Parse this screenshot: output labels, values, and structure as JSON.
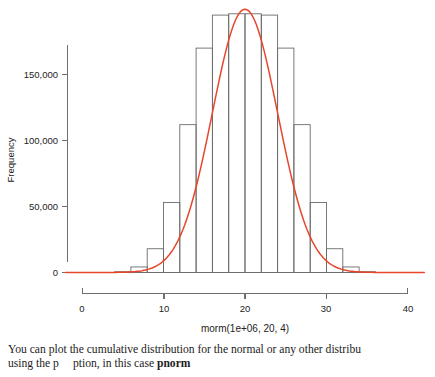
{
  "chart_data": {
    "type": "bar",
    "title": "",
    "subtitle": "",
    "xlabel": "morm(1e+06, 20, 4)",
    "ylabel": "Frequency",
    "xlim": [
      -2,
      42
    ],
    "ylim": [
      0,
      200000
    ],
    "grid": false,
    "legend_position": "none",
    "x_ticks": [
      0,
      10,
      20,
      30,
      40
    ],
    "x_tick_labels": [
      "0",
      "10",
      "20",
      "30",
      "40"
    ],
    "y_ticks": [
      0,
      50000,
      100000,
      150000
    ],
    "y_tick_labels": [
      "0",
      "50,000",
      "100,000",
      "150,000"
    ],
    "bin_width": 2,
    "bar_color": "none",
    "bar_edge_color": "#6b6b6b",
    "curve_color": "#e8462b",
    "bins": [
      {
        "x0": 2,
        "x1": 4,
        "count": 60
      },
      {
        "x0": 4,
        "x1": 6,
        "count": 600
      },
      {
        "x0": 6,
        "x1": 8,
        "count": 4200
      },
      {
        "x0": 8,
        "x1": 10,
        "count": 18000
      },
      {
        "x0": 10,
        "x1": 12,
        "count": 53000
      },
      {
        "x0": 12,
        "x1": 14,
        "count": 112000
      },
      {
        "x0": 14,
        "x1": 16,
        "count": 170000
      },
      {
        "x0": 16,
        "x1": 18,
        "count": 195000
      },
      {
        "x0": 18,
        "x1": 20,
        "count": 196000
      },
      {
        "x0": 20,
        "x1": 22,
        "count": 196000
      },
      {
        "x0": 22,
        "x1": 24,
        "count": 195000
      },
      {
        "x0": 24,
        "x1": 26,
        "count": 170000
      },
      {
        "x0": 26,
        "x1": 28,
        "count": 112000
      },
      {
        "x0": 28,
        "x1": 30,
        "count": 53000
      },
      {
        "x0": 30,
        "x1": 32,
        "count": 18000
      },
      {
        "x0": 32,
        "x1": 34,
        "count": 4200
      },
      {
        "x0": 34,
        "x1": 36,
        "count": 600
      },
      {
        "x0": 36,
        "x1": 38,
        "count": 60
      }
    ],
    "curve": {
      "distribution": "normal",
      "mean": 20,
      "sd": 4,
      "n": 1000000,
      "peak_value": 199471,
      "description": "Red normal density curve scaled to histogram counts, peak at x=20"
    }
  },
  "caption": {
    "line1": "You can plot the cumulative distribution for the normal or any other distribu",
    "line2_part1": "using the p",
    "line2_part2": "ption, in this case",
    "line2_bold": "pnorm"
  }
}
